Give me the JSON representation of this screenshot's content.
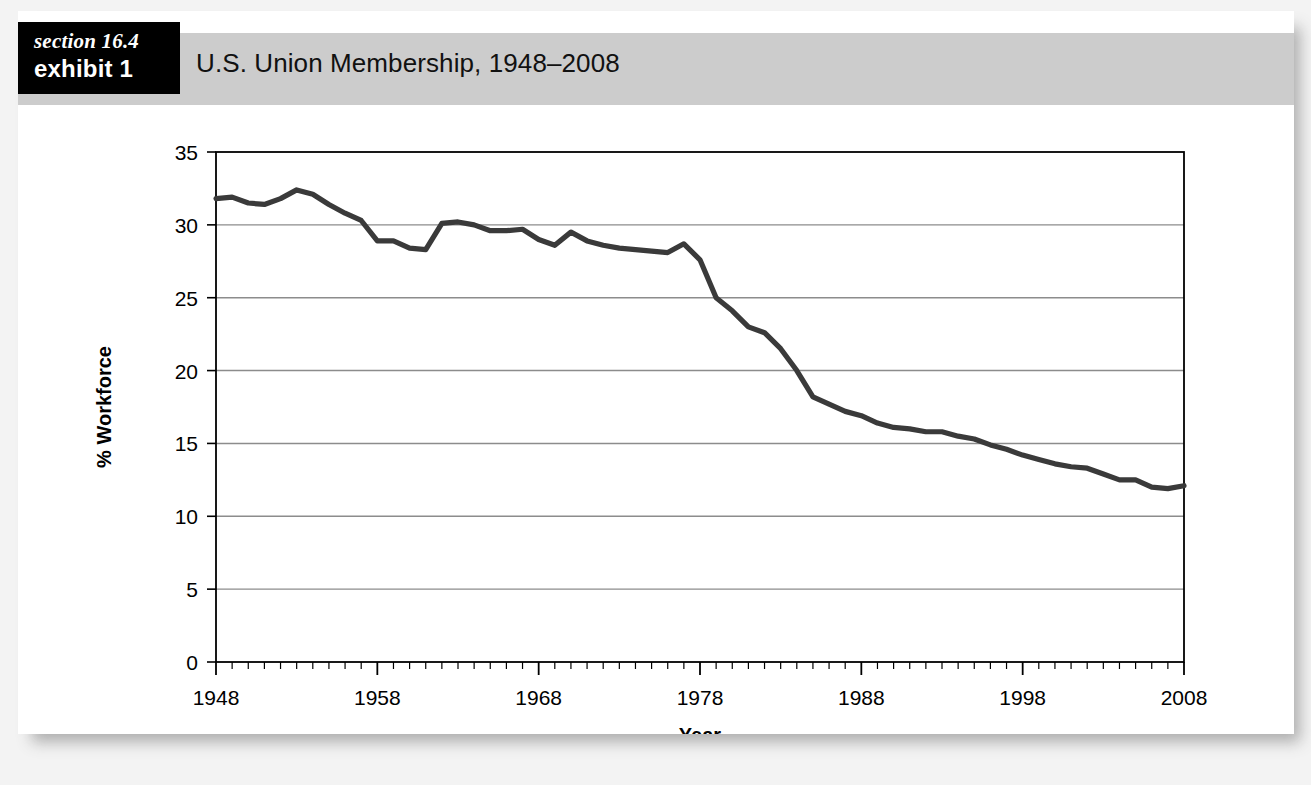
{
  "banner": {
    "section_label": "section 16.4",
    "exhibit_label": "exhibit 1",
    "title": "U.S. Union Membership, 1948–2008"
  },
  "colors": {
    "banner_background": "#cccccc",
    "tag_background": "#000000",
    "tag_text": "#ffffff",
    "line": "#3a3a3a",
    "gridline": "#8c8c8c",
    "axis": "#000000",
    "plot_background": "#ffffff"
  },
  "chart_data": {
    "type": "line",
    "title": "U.S. Union Membership, 1948–2008",
    "xlabel": "Year",
    "ylabel": "% Workforce",
    "xlim": [
      1948,
      2008
    ],
    "ylim": [
      0,
      35
    ],
    "ytick_labels": [
      "0",
      "5",
      "10",
      "15",
      "20",
      "25",
      "30",
      "35"
    ],
    "yticks": [
      0,
      5,
      10,
      15,
      20,
      25,
      30,
      35
    ],
    "xtick_labels": [
      "1948",
      "1958",
      "1968",
      "1978",
      "1988",
      "1998",
      "2008"
    ],
    "xticks": [
      1948,
      1958,
      1968,
      1978,
      1988,
      1998,
      2008
    ],
    "minor_xtick_interval": 1,
    "grid": "horizontal",
    "legend": "none",
    "series": [
      {
        "name": "% Workforce unionized",
        "x": [
          1948,
          1949,
          1950,
          1951,
          1952,
          1953,
          1954,
          1955,
          1956,
          1957,
          1958,
          1959,
          1960,
          1961,
          1962,
          1963,
          1964,
          1965,
          1966,
          1967,
          1968,
          1969,
          1970,
          1971,
          1972,
          1973,
          1974,
          1975,
          1976,
          1977,
          1978,
          1979,
          1980,
          1981,
          1982,
          1983,
          1984,
          1985,
          1986,
          1987,
          1988,
          1989,
          1990,
          1991,
          1992,
          1993,
          1994,
          1995,
          1996,
          1997,
          1998,
          1999,
          2000,
          2001,
          2002,
          2003,
          2004,
          2005,
          2006,
          2007,
          2008
        ],
        "y": [
          31.8,
          31.9,
          31.5,
          31.4,
          31.8,
          32.4,
          32.1,
          31.4,
          30.8,
          30.3,
          28.9,
          28.9,
          28.4,
          28.3,
          30.1,
          30.2,
          30.0,
          29.6,
          29.6,
          29.7,
          29.0,
          28.6,
          29.5,
          28.9,
          28.6,
          28.4,
          28.3,
          28.2,
          28.1,
          28.7,
          27.6,
          25.0,
          24.1,
          23.0,
          22.6,
          21.5,
          20.0,
          18.2,
          17.7,
          17.2,
          16.9,
          16.4,
          16.1,
          16.0,
          15.8,
          15.8,
          15.5,
          15.3,
          14.9,
          14.6,
          14.2,
          13.9,
          13.6,
          13.4,
          13.3,
          12.9,
          12.5,
          12.5,
          12.0,
          11.9,
          12.1
        ]
      }
    ]
  }
}
